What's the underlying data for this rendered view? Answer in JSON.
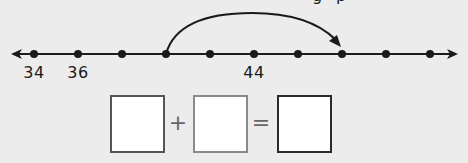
{
  "number_line": {
    "line_y": 54,
    "x_start": 11,
    "x_end": 458,
    "tick_x": [
      34,
      78,
      122,
      166,
      210,
      254,
      298,
      342,
      386,
      430
    ],
    "labels": [
      {
        "text": "34",
        "x": 34
      },
      {
        "text": "36",
        "x": 78
      },
      {
        "text": "44",
        "x": 254
      }
    ],
    "jump_arc": {
      "from_x": 166,
      "to_x": 342,
      "peak_y": 13
    }
  },
  "equation": {
    "boxes": [
      {
        "value": "",
        "x": 110,
        "border_color": "#555555"
      },
      {
        "value": "",
        "x": 193,
        "border_color": "#8a8a8a"
      },
      {
        "value": "",
        "x": 277,
        "border_color": "#2a2a2a"
      }
    ],
    "plus_symbol": "+",
    "equals_symbol": "="
  },
  "cropped_text_top": [
    "g",
    "p"
  ],
  "colors": {
    "background": "#ececec",
    "ink": "#1a1a1a"
  }
}
